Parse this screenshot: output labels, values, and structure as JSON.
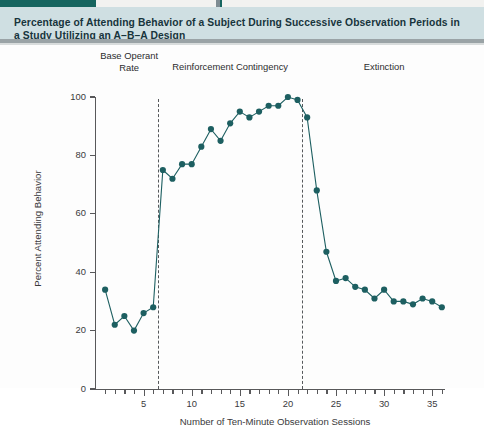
{
  "figure": {
    "caption": "Percentage of Attending Behavior of a Subject During Successive Observation Periods in a Study Utilizing an A–B–A Design",
    "accent_color": "#16655f",
    "caption_background": "#cfdfe2",
    "marker_color": "#1d5f61"
  },
  "chart_data": {
    "type": "line",
    "title": "Percentage of Attending Behavior of a Subject During Successive Observation Periods in a Study Utilizing an A–B–A Design",
    "xlabel": "Number of Ten-Minute Observation Sessions",
    "ylabel": "Percent Attending Behavior",
    "xlim": [
      0,
      37
    ],
    "ylim": [
      0,
      100
    ],
    "grid": false,
    "legend": "none",
    "x_ticks": [
      5,
      10,
      15,
      20,
      25,
      30,
      35
    ],
    "x_minor_ticks": [
      1,
      2,
      3,
      4,
      6,
      7,
      8,
      9,
      11,
      12,
      13,
      14,
      16,
      17,
      18,
      19,
      21,
      22,
      23,
      24,
      26,
      27,
      28,
      29,
      31,
      32,
      33,
      34,
      36
    ],
    "y_ticks": [
      0,
      20,
      40,
      60,
      80,
      100
    ],
    "marker": "filled-circle",
    "x": [
      1,
      2,
      3,
      4,
      5,
      6,
      7,
      8,
      9,
      10,
      11,
      12,
      13,
      14,
      15,
      16,
      17,
      18,
      19,
      20,
      21,
      22,
      23,
      24,
      25,
      26,
      27,
      28,
      29,
      30,
      31,
      32,
      33,
      34,
      35,
      36
    ],
    "values": [
      34,
      22,
      25,
      20,
      26,
      28,
      75,
      72,
      77,
      77,
      83,
      89,
      85,
      91,
      95,
      93,
      95,
      97,
      97,
      100,
      99,
      93,
      68,
      47,
      37,
      38,
      35,
      34,
      31,
      34,
      30,
      30,
      29,
      31,
      30,
      28
    ],
    "phases": [
      {
        "label": "Base Operant\nRate",
        "start": 1,
        "end": 6,
        "label_x": 3.5
      },
      {
        "label": "Reinforcement Contingency",
        "start": 7,
        "end": 21,
        "label_x": 14
      },
      {
        "label": "Extinction",
        "start": 22,
        "end": 36,
        "label_x": 30
      }
    ],
    "phase_dividers": [
      6.5,
      21.5
    ],
    "annotations": []
  },
  "phase_labels": {
    "baseline_line1": "Base Operant",
    "baseline_line2": "Rate",
    "treatment": "Reinforcement Contingency",
    "extinction": "Extinction"
  }
}
